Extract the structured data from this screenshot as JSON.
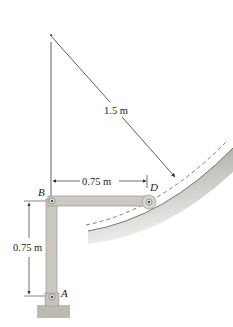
{
  "diagram": {
    "type": "mechanism",
    "labels": {
      "radius": "1.5 m",
      "horizontal_dim": "0.75 m",
      "vertical_dim": "0.75 m",
      "point_A": "A",
      "point_B": "B",
      "point_D": "D"
    },
    "colors": {
      "link": "#c9c7c0",
      "link_edge": "#8d8a83",
      "slot_shadow": "#b8b6b0",
      "ground": "#bdbab2",
      "line": "#333333"
    }
  }
}
